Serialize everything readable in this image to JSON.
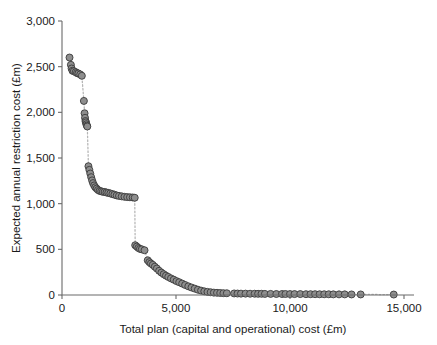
{
  "chart_data": {
    "type": "scatter",
    "title": "",
    "xlabel": "Total plan (capital and operational) cost (£m)",
    "ylabel": "Expected annual restriction cost (£m)",
    "xlim": [
      0,
      15600
    ],
    "ylim": [
      0,
      3000
    ],
    "xticks": [
      0,
      5000,
      10000,
      15000
    ],
    "xtick_labels": [
      "0",
      "5,000",
      "10,000",
      "15,000"
    ],
    "yticks": [
      0,
      500,
      1000,
      1500,
      2000,
      2500,
      3000
    ],
    "ytick_labels": [
      "0",
      "500",
      "1,000",
      "1,500",
      "2,000",
      "2,500",
      "3,000"
    ],
    "grid": false,
    "legend": null,
    "marker": {
      "shape": "circle",
      "fill_color": "#8e8e8e",
      "edge_color": "#3a3a3a",
      "size_px": 7
    },
    "connector": {
      "style": "dotted",
      "color": "#b5b5b5"
    },
    "series": [
      {
        "name": "Efficient frontier",
        "points": [
          [
            330,
            2600
          ],
          [
            390,
            2520
          ],
          [
            420,
            2480
          ],
          [
            460,
            2455
          ],
          [
            520,
            2450
          ],
          [
            600,
            2440
          ],
          [
            660,
            2430
          ],
          [
            720,
            2425
          ],
          [
            800,
            2415
          ],
          [
            870,
            2400
          ],
          [
            960,
            2125
          ],
          [
            990,
            1990
          ],
          [
            1010,
            1940
          ],
          [
            1030,
            1905
          ],
          [
            1050,
            1890
          ],
          [
            1070,
            1870
          ],
          [
            1090,
            1855
          ],
          [
            1110,
            1845
          ],
          [
            1160,
            1410
          ],
          [
            1200,
            1370
          ],
          [
            1240,
            1330
          ],
          [
            1280,
            1290
          ],
          [
            1320,
            1255
          ],
          [
            1360,
            1225
          ],
          [
            1410,
            1200
          ],
          [
            1460,
            1180
          ],
          [
            1520,
            1165
          ],
          [
            1580,
            1150
          ],
          [
            1650,
            1140
          ],
          [
            1720,
            1135
          ],
          [
            1790,
            1130
          ],
          [
            1870,
            1128
          ],
          [
            1950,
            1122
          ],
          [
            2030,
            1118
          ],
          [
            2120,
            1112
          ],
          [
            2210,
            1105
          ],
          [
            2300,
            1098
          ],
          [
            2400,
            1090
          ],
          [
            2500,
            1085
          ],
          [
            2620,
            1080
          ],
          [
            2740,
            1075
          ],
          [
            2860,
            1072
          ],
          [
            2980,
            1070
          ],
          [
            3100,
            1068
          ],
          [
            3190,
            1065
          ],
          [
            3210,
            545
          ],
          [
            3280,
            530
          ],
          [
            3350,
            515
          ],
          [
            3420,
            505
          ],
          [
            3500,
            500
          ],
          [
            3620,
            490
          ],
          [
            3760,
            380
          ],
          [
            3830,
            360
          ],
          [
            3900,
            345
          ],
          [
            3980,
            330
          ],
          [
            4070,
            310
          ],
          [
            4160,
            290
          ],
          [
            4260,
            265
          ],
          [
            4360,
            245
          ],
          [
            4460,
            228
          ],
          [
            4560,
            212
          ],
          [
            4660,
            198
          ],
          [
            4780,
            182
          ],
          [
            4900,
            168
          ],
          [
            5020,
            152
          ],
          [
            5140,
            140
          ],
          [
            5270,
            125
          ],
          [
            5400,
            110
          ],
          [
            5540,
            95
          ],
          [
            5680,
            82
          ],
          [
            5820,
            70
          ],
          [
            5960,
            58
          ],
          [
            6100,
            48
          ],
          [
            6240,
            40
          ],
          [
            6380,
            34
          ],
          [
            6520,
            30
          ],
          [
            6660,
            26
          ],
          [
            6800,
            24
          ],
          [
            6940,
            22
          ],
          [
            7080,
            20
          ],
          [
            7230,
            19
          ],
          [
            7550,
            17
          ],
          [
            7700,
            16
          ],
          [
            7850,
            15
          ],
          [
            8050,
            15
          ],
          [
            8250,
            14
          ],
          [
            8450,
            14
          ],
          [
            8600,
            13
          ],
          [
            8750,
            13
          ],
          [
            8900,
            12
          ],
          [
            9150,
            12
          ],
          [
            9400,
            11
          ],
          [
            9650,
            11
          ],
          [
            9800,
            11
          ],
          [
            10000,
            10
          ],
          [
            10200,
            10
          ],
          [
            10450,
            10
          ],
          [
            10700,
            9
          ],
          [
            10900,
            9
          ],
          [
            11100,
            9
          ],
          [
            11300,
            8
          ],
          [
            11500,
            8
          ],
          [
            11700,
            8
          ],
          [
            11900,
            7
          ],
          [
            12150,
            7
          ],
          [
            12400,
            7
          ],
          [
            12700,
            6
          ],
          [
            13100,
            6
          ],
          [
            14550,
            5
          ]
        ]
      }
    ]
  }
}
